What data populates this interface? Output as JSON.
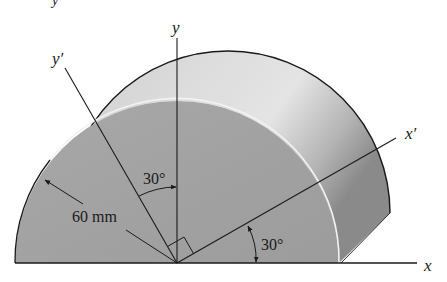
{
  "figure": {
    "axes": {
      "x_label": "x",
      "y_label": "y",
      "x_prime_label": "x′",
      "y_prime_label": "y′"
    },
    "dimensions": {
      "radius_label": "60 mm"
    },
    "angles": {
      "angle_between_y_and_y_prime": "30°",
      "angle_between_x_and_x_prime": "30°"
    },
    "colors": {
      "front_face": "#a3a3a3",
      "curved_surface_light": "#e2e2e2",
      "curved_surface_dark": "#8e8e8e",
      "line": "#1a1a1a"
    },
    "top_cropped_text": "y"
  }
}
